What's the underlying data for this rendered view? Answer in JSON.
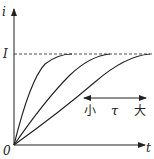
{
  "diagram": {
    "title": "",
    "y_axis_label": "i",
    "x_axis_label": "t",
    "origin_label": "0",
    "level_label": "I",
    "annotation": {
      "left": "小",
      "middle": "τ",
      "right": "大"
    },
    "curves": [
      {
        "name": "small-tau",
        "reaches_I_at_x": 72
      },
      {
        "name": "medium-tau",
        "reaches_I_at_x": 110
      },
      {
        "name": "large-tau",
        "reaches_I_at_x": 150
      }
    ],
    "colors": {
      "ink": "#222222",
      "background": "#ffffff"
    }
  }
}
